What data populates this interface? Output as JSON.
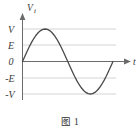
{
  "figure": {
    "caption": "图 1",
    "axes": {
      "y_axis_label": "V",
      "y_axis_sublabel": "i",
      "x_axis_label": "t",
      "y_ticks": [
        "V",
        "E",
        "0",
        "-E",
        "-V"
      ],
      "x_ticks": []
    },
    "colors": {
      "curve": "#4a4a4a",
      "axis": "#6b6b6b",
      "gridline": "#c9c9c9",
      "text": "#3b3b3b"
    }
  },
  "chart_data": {
    "type": "line",
    "title": "图 1",
    "xlabel": "t",
    "ylabel": "Vi",
    "grid": true,
    "legend_position": "none",
    "y_tick_labels": [
      "V",
      "E",
      "0",
      "-E",
      "-V"
    ],
    "y_tick_values": [
      1,
      0.5,
      0,
      -0.5,
      -1
    ],
    "ylim": [
      -1.3,
      1.3
    ],
    "xlim": [
      0,
      1.15
    ],
    "annotations": [
      "Sine wave begins at origin (0,0)",
      "Positive peak reaches V",
      "Negative trough reaches -V",
      "One full period shown"
    ],
    "series": [
      {
        "name": "Vi(t) = V sin(2πt)",
        "x": [
          0,
          0.025,
          0.05,
          0.075,
          0.1,
          0.125,
          0.15,
          0.175,
          0.2,
          0.225,
          0.25,
          0.275,
          0.3,
          0.325,
          0.35,
          0.375,
          0.4,
          0.425,
          0.45,
          0.475,
          0.5,
          0.525,
          0.55,
          0.575,
          0.6,
          0.625,
          0.65,
          0.675,
          0.7,
          0.725,
          0.75,
          0.775,
          0.8,
          0.825,
          0.85,
          0.875,
          0.9,
          0.925,
          0.95,
          0.975,
          1.0
        ],
        "y": [
          0,
          0.156,
          0.309,
          0.454,
          0.588,
          0.707,
          0.809,
          0.891,
          0.951,
          0.988,
          1.0,
          0.988,
          0.951,
          0.891,
          0.809,
          0.707,
          0.588,
          0.454,
          0.309,
          0.156,
          0,
          -0.156,
          -0.309,
          -0.454,
          -0.588,
          -0.707,
          -0.809,
          -0.891,
          -0.951,
          -0.988,
          -1.0,
          -0.988,
          -0.951,
          -0.891,
          -0.809,
          -0.707,
          -0.588,
          -0.454,
          -0.309,
          -0.156,
          0
        ]
      }
    ]
  }
}
